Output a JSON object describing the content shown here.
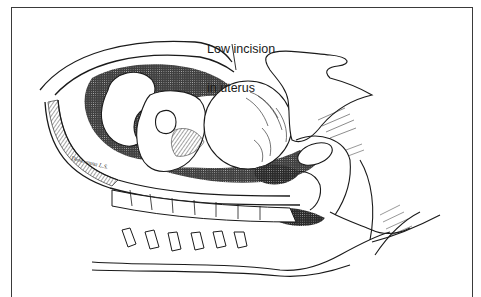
{
  "figure": {
    "type": "medical-illustration",
    "label": {
      "line1": "Low incision",
      "line2": "in uterus"
    },
    "signature": "Dion. anna L.S.",
    "colors": {
      "ink": "#1a1a1a",
      "frame": "#3a3a3a",
      "background": "#ffffff",
      "shade": "#2b2b2b"
    }
  }
}
